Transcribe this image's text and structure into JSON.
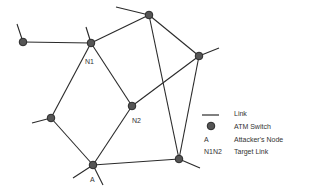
{
  "diagram": {
    "colors": {
      "link": "#2a2a2a",
      "node_fill": "#555555",
      "node_stroke": "#2a2a2a",
      "text": "#333333"
    },
    "nodes": [
      {
        "id": "far-left",
        "x": 23,
        "y": 42,
        "label": ""
      },
      {
        "id": "N1",
        "x": 91,
        "y": 43,
        "label": "N1"
      },
      {
        "id": "top",
        "x": 149,
        "y": 15,
        "label": ""
      },
      {
        "id": "right",
        "x": 199,
        "y": 56,
        "label": ""
      },
      {
        "id": "N2",
        "x": 132,
        "y": 106,
        "label": "N2"
      },
      {
        "id": "left-lower",
        "x": 51,
        "y": 118,
        "label": ""
      },
      {
        "id": "A",
        "x": 93,
        "y": 165,
        "label": "A"
      },
      {
        "id": "bottom-right",
        "x": 179,
        "y": 159,
        "label": ""
      }
    ],
    "links": [
      [
        "far-left",
        "N1"
      ],
      [
        "N1",
        "top"
      ],
      [
        "top",
        "right"
      ],
      [
        "top",
        "bottom-right"
      ],
      [
        "right",
        "N2"
      ],
      [
        "right",
        "bottom-right"
      ],
      [
        "N1",
        "N2"
      ],
      [
        "N1",
        "left-lower"
      ],
      [
        "left-lower",
        "A"
      ],
      [
        "N2",
        "A"
      ],
      [
        "A",
        "bottom-right"
      ]
    ],
    "labels": {
      "N1": "N1",
      "N2": "N2",
      "A": "A"
    },
    "legend": {
      "items": [
        {
          "symbol": "line",
          "text": "Link"
        },
        {
          "symbol": "circle",
          "text": "ATM Switch"
        },
        {
          "symbol": "A",
          "text": "Attacker's Node"
        },
        {
          "symbol": "N1N2",
          "text": "Target Link"
        }
      ]
    }
  }
}
